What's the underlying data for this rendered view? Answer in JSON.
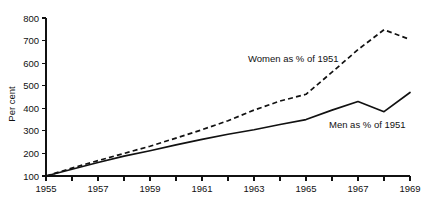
{
  "chart_data": {
    "type": "line",
    "title": "",
    "xlabel": "",
    "ylabel": "Per cent",
    "xlim": [
      1955,
      1969
    ],
    "ylim": [
      100,
      800
    ],
    "grid": false,
    "legend_position": "inline-annotations",
    "y_ticks": [
      100,
      200,
      300,
      400,
      500,
      600,
      700,
      800
    ],
    "y_tick_labels": [
      "100",
      "200",
      "300",
      "400",
      "500",
      "600",
      "700",
      "800"
    ],
    "x_ticks": [
      1955,
      1956,
      1957,
      1958,
      1959,
      1960,
      1961,
      1962,
      1963,
      1964,
      1965,
      1966,
      1967,
      1968,
      1969
    ],
    "x_tick_labels_shown": [
      "1955",
      "1957",
      "1959",
      "1961",
      "1963",
      "1965",
      "1967",
      "1969"
    ],
    "x_labeled_years": [
      1955,
      1957,
      1959,
      1961,
      1963,
      1965,
      1967,
      1969
    ],
    "x": [
      1955,
      1956,
      1957,
      1958,
      1959,
      1960,
      1961,
      1962,
      1963,
      1964,
      1965,
      1966,
      1967,
      1968,
      1969
    ],
    "series": [
      {
        "name": "Women as % of 1951",
        "style": "dashed",
        "color": "#111111",
        "values": [
          100,
          135,
          168,
          200,
          232,
          268,
          305,
          345,
          392,
          432,
          462,
          560,
          660,
          748,
          705
        ]
      },
      {
        "name": "Men as % of 1951",
        "style": "solid",
        "color": "#111111",
        "values": [
          100,
          130,
          160,
          188,
          212,
          238,
          262,
          285,
          305,
          328,
          350,
          392,
          430,
          385,
          470
        ]
      }
    ],
    "annotations": [
      {
        "name": "women-series-label",
        "text": "Women as % of 1951",
        "x_px": 248,
        "y_px": 62
      },
      {
        "name": "men-series-label",
        "text": "Men as % of 1951",
        "x_px": 329,
        "y_px": 128
      }
    ]
  }
}
